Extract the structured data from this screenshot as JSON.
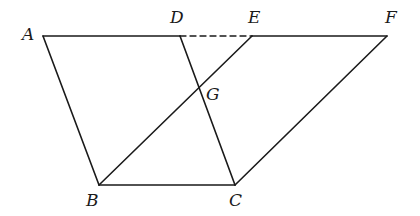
{
  "diagram": {
    "type": "geometry-figure",
    "points": {
      "A": {
        "label": "A",
        "x": 43,
        "y": 36,
        "lx": 22,
        "ly": 40
      },
      "D": {
        "label": "D",
        "x": 180,
        "y": 36,
        "lx": 170,
        "ly": 23
      },
      "E": {
        "label": "E",
        "x": 252,
        "y": 36,
        "lx": 248,
        "ly": 23
      },
      "F": {
        "label": "F",
        "x": 387,
        "y": 36,
        "lx": 385,
        "ly": 23
      },
      "G": {
        "label": "G",
        "x": 199,
        "y": 88,
        "lx": 206,
        "ly": 100
      },
      "B": {
        "label": "B",
        "x": 99,
        "y": 185,
        "lx": 86,
        "ly": 206
      },
      "C": {
        "label": "C",
        "x": 235,
        "y": 185,
        "lx": 229,
        "ly": 206
      }
    },
    "segments": [
      {
        "from": "A",
        "to": "D",
        "style": "solid"
      },
      {
        "from": "D",
        "to": "E",
        "style": "dashed"
      },
      {
        "from": "E",
        "to": "F",
        "style": "solid"
      },
      {
        "from": "A",
        "to": "B",
        "style": "solid"
      },
      {
        "from": "B",
        "to": "C",
        "style": "solid"
      },
      {
        "from": "C",
        "to": "F",
        "style": "solid"
      },
      {
        "from": "D",
        "to": "C",
        "style": "solid"
      },
      {
        "from": "B",
        "to": "E",
        "style": "solid"
      }
    ],
    "stroke_color": "#1a1a1a",
    "background": "#ffffff"
  }
}
